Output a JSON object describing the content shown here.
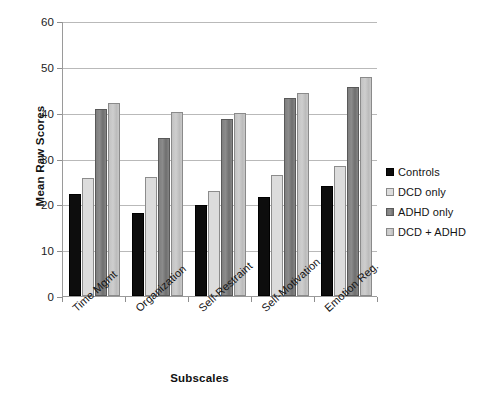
{
  "chart_data": {
    "type": "bar",
    "title": "",
    "xlabel": "Subscales",
    "ylabel": "Mean Raw Scores",
    "ylim": [
      0,
      60
    ],
    "ytick_values": [
      0,
      10,
      20,
      30,
      40,
      50,
      60
    ],
    "ytick_labels": [
      "0",
      "10",
      "20",
      "30",
      "40",
      "50",
      "60"
    ],
    "grid": true,
    "legend_position": "right",
    "categories": [
      "Time Mgmt",
      "Organization",
      "Self-Restraint",
      "Self-Motivation",
      "Emotion Reg."
    ],
    "series": [
      {
        "name": "Controls",
        "color": "#0d0d0d",
        "values": [
          22.2,
          18.2,
          19.8,
          21.5,
          23.9
        ]
      },
      {
        "name": "DCD only",
        "color": "#dcdcdc",
        "values": [
          25.8,
          25.9,
          22.9,
          26.5,
          28.4
        ]
      },
      {
        "name": "ADHD only",
        "color": "#7f7f7f",
        "values": [
          40.8,
          34.4,
          38.6,
          43.3,
          45.6
        ]
      },
      {
        "name": "DCD + ADHD",
        "color": "#c6c6c6",
        "values": [
          42.1,
          40.1,
          40.0,
          44.2,
          47.8
        ]
      }
    ]
  },
  "legend": {
    "items": [
      {
        "label": "Controls"
      },
      {
        "label": "DCD only"
      },
      {
        "label": "ADHD only"
      },
      {
        "label": "DCD + ADHD"
      }
    ]
  }
}
